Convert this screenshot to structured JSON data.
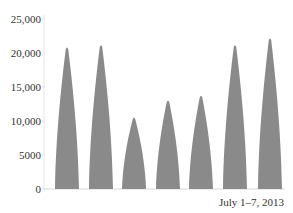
{
  "chart_data": {
    "type": "area",
    "title": "",
    "xlabel": "July 1–7, 2013",
    "ylabel": "",
    "ylim": [
      0,
      25000
    ],
    "yticks": [
      0,
      5000,
      10000,
      15000,
      20000,
      25000
    ],
    "ytick_labels": [
      "0",
      "5000",
      "10,000",
      "15,000",
      "20,000",
      "25,000"
    ],
    "grid": false,
    "legend": null,
    "categories": [
      "July 1",
      "July 2",
      "July 3",
      "July 4",
      "July 5",
      "July 6",
      "July 7"
    ],
    "values": [
      20900,
      21200,
      10600,
      13100,
      13800,
      21200,
      22200
    ],
    "series_color": "#8a8a8a"
  },
  "axis": {
    "color": "#d8d8d8"
  }
}
